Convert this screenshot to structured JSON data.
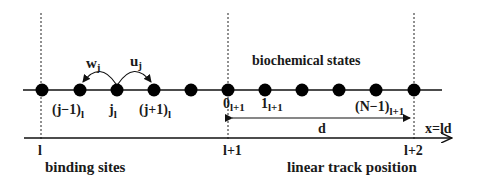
{
  "diagram": {
    "colors": {
      "ink": "#111111",
      "background": "#ffffff"
    },
    "labels": {
      "biochemical_states": "biochemical states",
      "binding_sites": "binding sites",
      "linear_track_position": "linear track position",
      "distance": "d",
      "position_formula": "x=ld"
    },
    "rates": {
      "backward": {
        "main": "w",
        "sub": "j"
      },
      "forward": {
        "main": "u",
        "sub": "j"
      }
    },
    "state_labels": [
      {
        "main": "(j−1)",
        "sub": "l"
      },
      {
        "main": "j",
        "sub": "l"
      },
      {
        "main": "(j+1)",
        "sub": "l"
      },
      {
        "main": "0",
        "sub": "l+1"
      },
      {
        "main": "1",
        "sub": "l+1"
      },
      {
        "main": "(N−1)",
        "sub": "l+1"
      }
    ],
    "site_labels": [
      "l",
      "l+1",
      "l+2"
    ],
    "state_dot_positions_x": [
      42,
      80,
      117,
      154,
      191,
      228,
      265,
      302,
      339,
      376,
      414
    ]
  }
}
